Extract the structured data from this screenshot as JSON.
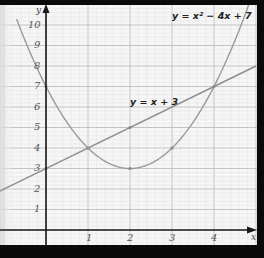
{
  "chart_data": {
    "type": "line",
    "title": "",
    "xlabel": "x",
    "ylabel": "y",
    "xlim": [
      -1.1,
      5.0
    ],
    "ylim": [
      -0.7,
      11.1
    ],
    "grid": true,
    "x_ticks": [
      "1",
      "2",
      "3",
      "4"
    ],
    "y_ticks": [
      "1",
      "2",
      "3",
      "4",
      "5",
      "6",
      "7",
      "8",
      "9",
      "10"
    ],
    "series": [
      {
        "name": "y = x² − 4x + 7",
        "type": "curve",
        "equation": "x^2 - 4x + 7",
        "x": [
          -0.6,
          0,
          1,
          2,
          3,
          4,
          4.85
        ],
        "values": [
          9.76,
          7,
          4,
          3,
          4,
          7,
          11.12
        ],
        "color": "#9a9a9a"
      },
      {
        "name": "y = x + 3",
        "type": "line",
        "equation": "x + 3",
        "x": [
          -1.1,
          0,
          1,
          2,
          3,
          4,
          5
        ],
        "values": [
          1.9,
          3,
          4,
          5,
          6,
          7,
          8
        ],
        "color": "#8c8c8c"
      }
    ],
    "marked_points": [
      {
        "x": 0,
        "y": 7
      },
      {
        "x": 0,
        "y": 3
      },
      {
        "x": 1,
        "y": 4
      },
      {
        "x": 2,
        "y": 5
      },
      {
        "x": 2,
        "y": 3
      },
      {
        "x": 3,
        "y": 4
      },
      {
        "x": 4,
        "y": 7
      }
    ],
    "annotations": [
      {
        "text": "y = x² − 4x + 7",
        "near": "top-right"
      },
      {
        "text": "y = x + 3",
        "near": "line above x=2"
      }
    ],
    "legend": "none (inline labels)"
  },
  "labels": {
    "x_axis": "x",
    "y_axis": "y",
    "eq_parabola": "y = x² − 4x + 7",
    "eq_line": "y = x + 3",
    "xt1": "1",
    "xt2": "2",
    "xt3": "3",
    "xt4": "4",
    "yt1": "1",
    "yt2": "2",
    "yt3": "3",
    "yt4": "4",
    "yt5": "5",
    "yt6": "6",
    "yt7": "7",
    "yt8": "8",
    "yt9": "9",
    "yt10": "10"
  }
}
